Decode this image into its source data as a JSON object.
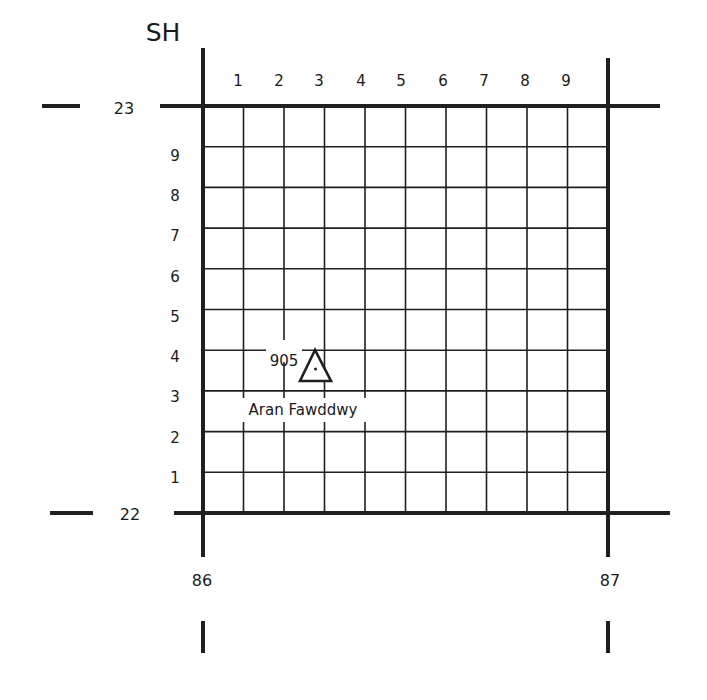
{
  "grid_square": "SH",
  "eastings": {
    "left": "86",
    "right": "87"
  },
  "northings": {
    "top": "23",
    "bottom": "22"
  },
  "column_labels": [
    "1",
    "2",
    "3",
    "4",
    "5",
    "6",
    "7",
    "8",
    "9"
  ],
  "row_labels": [
    "9",
    "8",
    "7",
    "6",
    "5",
    "4",
    "3",
    "2",
    "1"
  ],
  "feature": {
    "type": "trig-point",
    "height": "905",
    "name": "Aran Fawddwy"
  }
}
